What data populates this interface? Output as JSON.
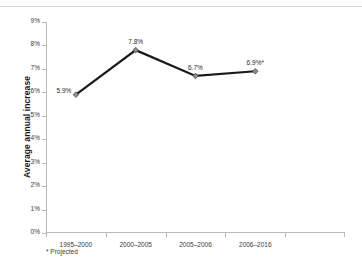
{
  "chart_data": {
    "type": "line",
    "title": "",
    "xlabel": "",
    "ylabel": "Average annual increase",
    "categories": [
      "1995–2000",
      "2000–2005",
      "2005–2006",
      "2006–2016"
    ],
    "values": [
      5.9,
      7.8,
      6.7,
      6.9
    ],
    "point_labels": [
      "5.9%",
      "7.8%",
      "6.7%",
      "6.9%*"
    ],
    "ylim": [
      0,
      9
    ],
    "ytick_values": [
      0,
      1,
      2,
      3,
      4,
      5,
      6,
      7,
      8,
      9
    ],
    "ytick_labels": [
      "0%",
      "1%",
      "2%",
      "3%",
      "4%",
      "5%",
      "6%",
      "7%",
      "8%",
      "9%"
    ],
    "grid": false,
    "legend": "none",
    "footnote": "* Projected",
    "line_color": "#1a1a1a",
    "marker_color": "#8d8d8d",
    "marker_edge_color": "#4a4a4a",
    "axis_color": "#b9b9b9",
    "text_color": "#2a2a2a",
    "background": "#ffffff"
  }
}
